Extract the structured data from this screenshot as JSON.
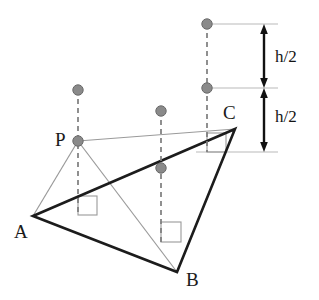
{
  "figure": {
    "kind": "geometry-diagram",
    "width": 319,
    "height": 300,
    "background_color": "#ffffff"
  },
  "colors": {
    "triangle_stroke": "#1c1c1c",
    "thin_stroke": "#9a9a9a",
    "dashed_stroke": "#7d7d7d",
    "dot_fill": "#8a8a8a",
    "dot_stroke": "#6a6a6a",
    "reference_line": "#b9b9b9",
    "right_angle_box": "#9a9a9a",
    "arrow_color": "#111111",
    "label_color": "#1a1a1a"
  },
  "vertices": [
    {
      "id": "A",
      "label": "A",
      "x": 33,
      "y": 216,
      "label_x": 14,
      "label_y": 222
    },
    {
      "id": "B",
      "label": "B",
      "x": 177,
      "y": 272,
      "label_x": 186,
      "label_y": 270
    },
    {
      "id": "C",
      "label": "C",
      "x": 235,
      "y": 129,
      "label_x": 223,
      "label_y": 103
    },
    {
      "id": "P",
      "label": "P",
      "x": 78,
      "y": 141,
      "label_x": 55,
      "label_y": 130
    }
  ],
  "triangle": {
    "name": "triangle-abc",
    "points": "33,216 177,272 235,129",
    "stroke_width": 2.6
  },
  "thin_segments": [
    {
      "name": "segment-p-a",
      "x1": 78,
      "y1": 141,
      "x2": 33,
      "y2": 216
    },
    {
      "name": "segment-p-b",
      "x1": 78,
      "y1": 141,
      "x2": 177,
      "y2": 272
    },
    {
      "name": "segment-p-c",
      "x1": 78,
      "y1": 141,
      "x2": 235,
      "y2": 129
    }
  ],
  "dashed_verticals": [
    {
      "name": "dashed-vertical-p",
      "x": 78,
      "y1": 90,
      "y2": 214
    },
    {
      "name": "dashed-vertical-middle",
      "x": 161,
      "y1": 111,
      "y2": 242
    },
    {
      "name": "dashed-vertical-c",
      "x": 207,
      "y1": 24,
      "y2": 152
    }
  ],
  "dots": [
    {
      "name": "dot-above-p",
      "x": 78,
      "y": 90,
      "r": 5.2
    },
    {
      "name": "dot-at-p",
      "x": 78,
      "y": 141,
      "r": 5.2
    },
    {
      "name": "dot-middle-upper",
      "x": 161,
      "y": 111,
      "r": 5.2
    },
    {
      "name": "dot-middle-lower",
      "x": 161,
      "y": 168,
      "r": 5.2
    },
    {
      "name": "dot-c-top",
      "x": 207,
      "y": 24,
      "r": 5.2
    },
    {
      "name": "dot-c-mid",
      "x": 207,
      "y": 88,
      "r": 5.2
    }
  ],
  "right_angle_boxes": [
    {
      "name": "right-angle-box-p",
      "x": 78,
      "y": 196,
      "size": 19
    },
    {
      "name": "right-angle-box-middle",
      "x": 161,
      "y": 222,
      "size": 20
    },
    {
      "name": "right-angle-box-c",
      "x": 207,
      "y": 133,
      "size": 19
    }
  ],
  "reference_lines": [
    {
      "name": "reference-line-top",
      "x1": 207,
      "y": 24,
      "x2": 278
    },
    {
      "name": "reference-line-middle",
      "x1": 207,
      "y": 88,
      "x2": 278
    },
    {
      "name": "reference-line-bottom",
      "x1": 196,
      "y": 152,
      "x2": 278
    }
  ],
  "dimension_bracket": {
    "name": "height-bracket",
    "axis_x": 264,
    "segments": [
      {
        "name": "dimension-upper-half",
        "label": "h/2",
        "y_top": 24,
        "y_bottom": 88,
        "label_x": 275,
        "label_y": 48
      },
      {
        "name": "dimension-lower-half",
        "label": "h/2",
        "y_top": 88,
        "y_bottom": 152,
        "label_x": 275,
        "label_y": 108
      }
    ]
  }
}
